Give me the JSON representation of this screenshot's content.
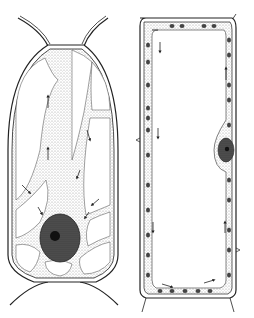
{
  "figure": {
    "panels": [
      {
        "id": "left",
        "subject": "plant cell with cytoplasmic strands and central nucleus",
        "arrows": 10
      },
      {
        "id": "right",
        "subject": "elongated plant cell with peripheral chloroplasts and lateral nucleus",
        "arrows": 8
      }
    ],
    "colors": {
      "ink": "#222222",
      "stipple": "#bdbdbd",
      "nucleus": "#3a3a3a",
      "nucleolus": "#111111",
      "background": "#ffffff"
    }
  }
}
